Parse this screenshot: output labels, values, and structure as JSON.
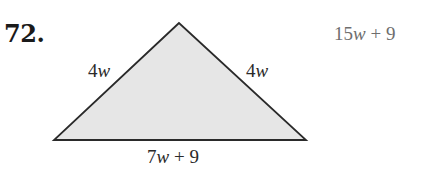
{
  "problem": {
    "number": "72."
  },
  "triangle": {
    "vertices": {
      "apex": [
        179,
        23
      ],
      "bottom_left": [
        54,
        140
      ],
      "bottom_right": [
        306,
        140
      ]
    },
    "fill_color": "#e6e6e6",
    "stroke_color": "#2a2a2a",
    "sides": {
      "left": {
        "coef": "4",
        "var": "w",
        "text": "4w"
      },
      "right": {
        "coef": "4",
        "var": "w",
        "text": "4w"
      },
      "bottom": {
        "coef": "7",
        "var": "w",
        "rest": " + 9",
        "text": "7w + 9"
      }
    }
  },
  "answer": {
    "coef": "15",
    "var": "w",
    "rest": " + 9",
    "text": "15w + 9",
    "color": "#6e6e6e"
  }
}
